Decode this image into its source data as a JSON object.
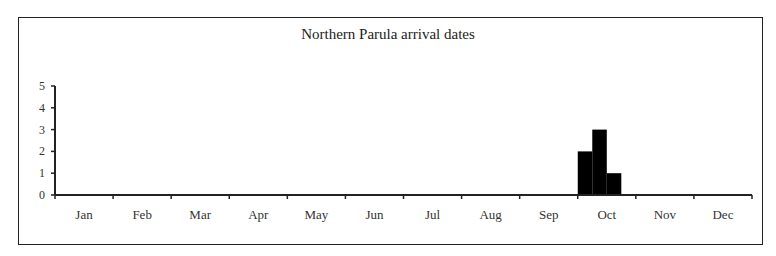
{
  "chart_data": {
    "type": "bar",
    "title": "Northern Parula arrival dates",
    "xlabel": "",
    "ylabel": "",
    "ylim": [
      0,
      5
    ],
    "yticks": [
      0,
      1,
      2,
      3,
      4,
      5
    ],
    "categories": [
      "Jan",
      "Feb",
      "Mar",
      "Apr",
      "May",
      "Jun",
      "Jul",
      "Aug",
      "Sep",
      "Oct",
      "Nov",
      "Dec"
    ],
    "grid": false,
    "legend": null,
    "bars": [
      {
        "month": "Oct",
        "bin": 1,
        "value": 2
      },
      {
        "month": "Oct",
        "bin": 2,
        "value": 3
      },
      {
        "month": "Oct",
        "bin": 3,
        "value": 1
      }
    ],
    "bar_color": "#000000"
  }
}
